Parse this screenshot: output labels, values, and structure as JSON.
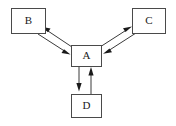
{
  "diagram": {
    "type": "node-edge-graph",
    "background_color": "#ffffff",
    "node_fill_color": "#ffffff",
    "node_border_color": "#4a4a4a",
    "edge_color": "#3a3a3a",
    "label_color": "#1a1a1a",
    "nodes": [
      {
        "id": "B",
        "label": "B",
        "x": 11,
        "y": 8,
        "width": 34,
        "height": 25
      },
      {
        "id": "C",
        "label": "C",
        "x": 132,
        "y": 8,
        "width": 33,
        "height": 25
      },
      {
        "id": "A",
        "label": "A",
        "x": 71,
        "y": 45,
        "width": 30,
        "height": 21
      },
      {
        "id": "D",
        "label": "D",
        "x": 71,
        "y": 94,
        "width": 30,
        "height": 23
      }
    ],
    "edges": [
      {
        "from": "A",
        "to": "B",
        "direction": "A-to-B",
        "orientation": "up-left"
      },
      {
        "from": "B",
        "to": "A",
        "direction": "B-to-A",
        "orientation": "down-right"
      },
      {
        "from": "A",
        "to": "C",
        "direction": "A-to-C",
        "orientation": "up-right"
      },
      {
        "from": "C",
        "to": "A",
        "direction": "C-to-A",
        "orientation": "down-left"
      },
      {
        "from": "A",
        "to": "D",
        "direction": "A-to-D",
        "orientation": "down"
      },
      {
        "from": "D",
        "to": "A",
        "direction": "D-to-A",
        "orientation": "up"
      }
    ],
    "edge_pairs": [
      {
        "between": "A and B",
        "bidirectional": true
      },
      {
        "between": "A and C",
        "bidirectional": true
      },
      {
        "between": "A and D",
        "bidirectional": true
      }
    ]
  }
}
